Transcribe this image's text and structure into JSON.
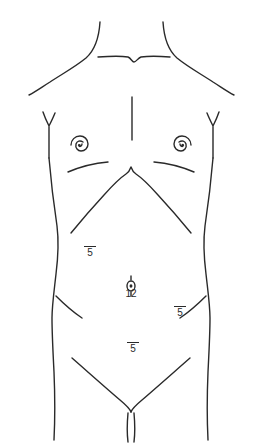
{
  "figure": {
    "kind": "anatomical-line-drawing",
    "background_color": "#ffffff",
    "stroke_color": "#2a2a2a"
  },
  "markers": [
    {
      "id": "upper-left-abdomen",
      "value": "5",
      "overbar": true,
      "x": 90,
      "y": 252
    },
    {
      "id": "umbilicus",
      "value": "12",
      "overbar": false,
      "x": 131,
      "y": 295
    },
    {
      "id": "right-lower-abdomen",
      "value": "5",
      "overbar": true,
      "x": 180,
      "y": 312
    },
    {
      "id": "suprapubic",
      "value": "5",
      "overbar": true,
      "x": 133,
      "y": 348
    }
  ],
  "anatomy": {
    "neck_left": "neck-contour-left",
    "neck_right": "neck-contour-right",
    "shoulder_left": "shoulder-contour-left",
    "shoulder_right": "shoulder-contour-right",
    "clavicle": "clavicle-line-with-suprasternal-notch",
    "sternum": "sternum-midline",
    "nipple_left": "areola-spiral-left",
    "nipple_right": "areola-spiral-right",
    "inframammary_left": "inframammary-fold-left",
    "inframammary_right": "inframammary-fold-right",
    "costal_margin": "costal-margin-arch-with-xiphoid-notch",
    "flank_left": "flank-contour-left",
    "flank_right": "flank-contour-right",
    "axilla_left": "axilla-junction-left",
    "axilla_right": "axilla-junction-right",
    "iliac_left": "iliac-crest-line-left",
    "iliac_right": "iliac-crest-line-right",
    "inguinal_left": "inguinal-crease-left",
    "inguinal_right": "inguinal-crease-right",
    "genital_cleft": "genital-cleft",
    "umbilicus_glyph": "umbilicus-oval-glyph"
  }
}
